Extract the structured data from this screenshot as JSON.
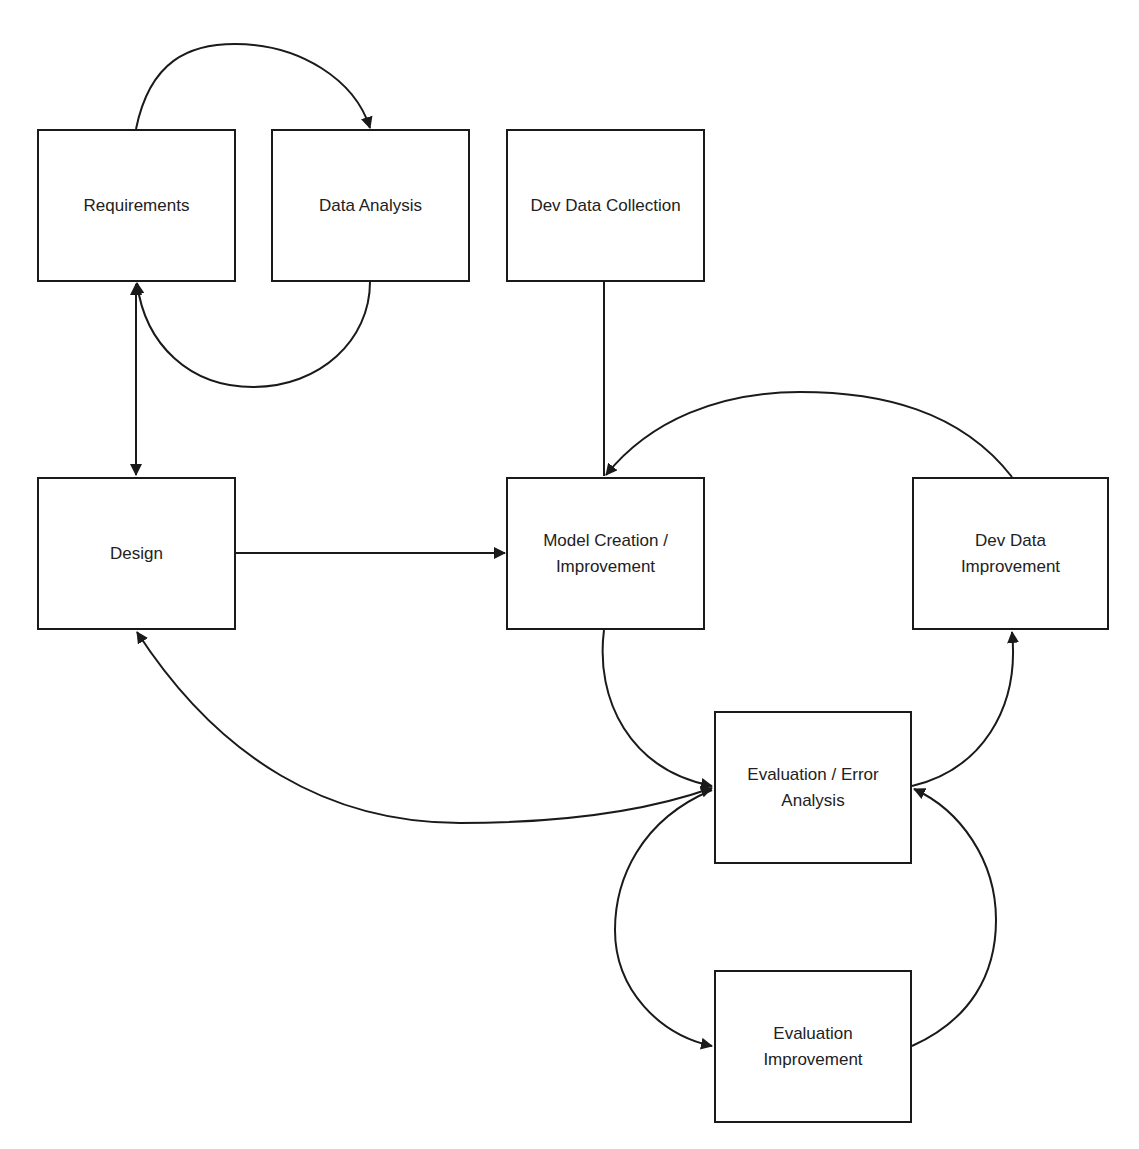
{
  "diagram": {
    "stroke_color": "#1a1a1a",
    "text_color": "#222222",
    "background": "#ffffff",
    "nodes": [
      {
        "id": "requirements",
        "label": "Requirements",
        "x": 37,
        "y": 129,
        "w": 199,
        "h": 153
      },
      {
        "id": "data-analysis",
        "label": "Data Analysis",
        "x": 271,
        "y": 129,
        "w": 199,
        "h": 153
      },
      {
        "id": "dev-data-collection",
        "label": "Dev Data Collection",
        "x": 506,
        "y": 129,
        "w": 199,
        "h": 153
      },
      {
        "id": "design",
        "label": "Design",
        "x": 37,
        "y": 477,
        "w": 199,
        "h": 153
      },
      {
        "id": "model-creation",
        "label": "Model Creation /\nImprovement",
        "x": 506,
        "y": 477,
        "w": 199,
        "h": 153
      },
      {
        "id": "dev-data-improvement",
        "label": "Dev Data\nImprovement",
        "x": 912,
        "y": 477,
        "w": 197,
        "h": 153
      },
      {
        "id": "evaluation-error-analysis",
        "label": "Evaluation / Error\nAnalysis",
        "x": 714,
        "y": 711,
        "w": 198,
        "h": 153
      },
      {
        "id": "evaluation-improvement",
        "label": "Evaluation\nImprovement",
        "x": 714,
        "y": 970,
        "w": 198,
        "h": 153
      }
    ],
    "edges": [
      {
        "from": "requirements",
        "to": "data-analysis",
        "style": "arc-over",
        "arrow": "end"
      },
      {
        "from": "data-analysis",
        "to": "requirements",
        "style": "arc-under",
        "arrow": "end"
      },
      {
        "from": "requirements",
        "to": "design",
        "style": "straight",
        "arrow": "both"
      },
      {
        "from": "design",
        "to": "model-creation",
        "style": "straight",
        "arrow": "end"
      },
      {
        "from": "dev-data-collection",
        "to": "model-creation",
        "style": "straight",
        "arrow": "none"
      },
      {
        "from": "dev-data-improvement",
        "to": "model-creation",
        "style": "arc-over",
        "arrow": "end"
      },
      {
        "from": "model-creation",
        "to": "evaluation-error-analysis",
        "style": "curve",
        "arrow": "end"
      },
      {
        "from": "evaluation-error-analysis",
        "to": "dev-data-improvement",
        "style": "curve",
        "arrow": "end"
      },
      {
        "from": "design",
        "to": "evaluation-error-analysis",
        "style": "curve",
        "arrow": "both"
      },
      {
        "from": "evaluation-error-analysis",
        "to": "evaluation-improvement",
        "style": "curve",
        "arrow": "end"
      },
      {
        "from": "evaluation-improvement",
        "to": "evaluation-error-analysis",
        "style": "curve",
        "arrow": "end"
      }
    ]
  }
}
